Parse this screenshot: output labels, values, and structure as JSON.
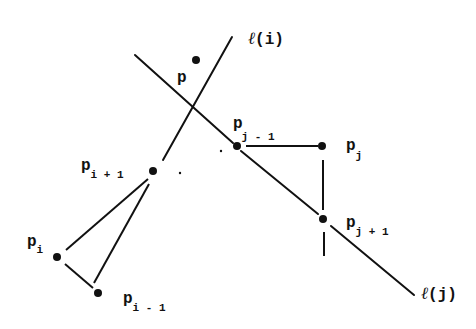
{
  "diagram": {
    "type": "geometric-construction",
    "stroke_color": "#111111",
    "background": "#ffffff",
    "lines": {
      "l_i": {
        "label_ell": "ℓ",
        "label_arg": "(i)"
      },
      "l_j": {
        "label_ell": "ℓ",
        "label_arg": "(j)"
      }
    },
    "points": {
      "p": {
        "base": "p",
        "sub": ""
      },
      "pj_minus_1": {
        "base": "p",
        "sub": "j - 1"
      },
      "pj": {
        "base": "p",
        "sub": "j"
      },
      "pj_plus_1": {
        "base": "p",
        "sub": "j + 1"
      },
      "pi_plus_1": {
        "base": "p",
        "sub": "i + 1"
      },
      "pi": {
        "base": "p",
        "sub": "i"
      },
      "pi_minus_1": {
        "base": "p",
        "sub": "i - 1"
      }
    },
    "edges": [
      [
        "pj_minus_1",
        "pj"
      ],
      [
        "pj",
        "pj_plus_1"
      ],
      [
        "pi_plus_1",
        "pi"
      ],
      [
        "pi_plus_1",
        "pi_minus_1"
      ],
      [
        "pi",
        "pi_minus_1"
      ]
    ]
  }
}
